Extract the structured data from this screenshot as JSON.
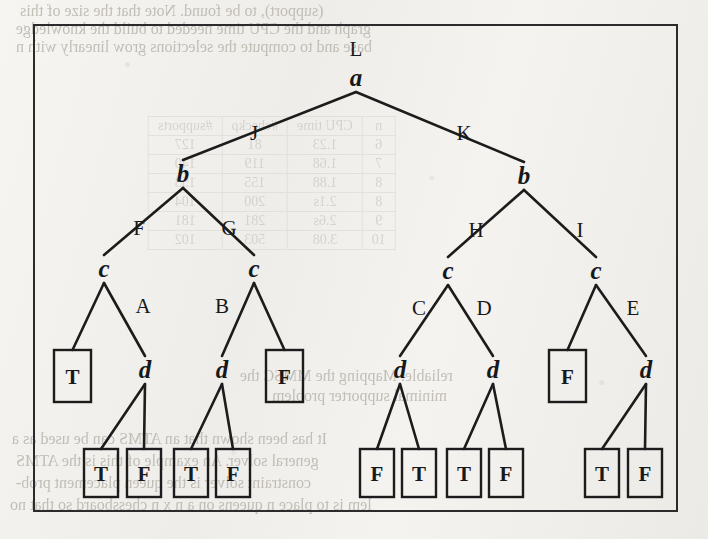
{
  "figure": {
    "caption": "",
    "frame": {
      "x": 33,
      "y": 24,
      "width": 645,
      "height": 488,
      "border_color": "#2b2b2b"
    }
  },
  "colors": {
    "ink": "#17181a",
    "line": "#1c1c1c",
    "paper": "#f2f1ee",
    "bleed_text": "#b9b5ad"
  },
  "tree": {
    "type": "derivation-tree",
    "root_label": "L",
    "nodes": [
      {
        "id": "n0",
        "label": "a",
        "kind": "nonterminal",
        "x": 356,
        "y": 86,
        "top_label": "L"
      },
      {
        "id": "n1",
        "label": "b",
        "kind": "nonterminal",
        "x": 183,
        "y": 182
      },
      {
        "id": "n2",
        "label": "b",
        "kind": "nonterminal",
        "x": 524,
        "y": 184
      },
      {
        "id": "n3",
        "label": "c",
        "kind": "nonterminal",
        "x": 104,
        "y": 277
      },
      {
        "id": "n4",
        "label": "c",
        "kind": "nonterminal",
        "x": 254,
        "y": 277
      },
      {
        "id": "n5",
        "label": "c",
        "kind": "nonterminal",
        "x": 448,
        "y": 279
      },
      {
        "id": "n6",
        "label": "c",
        "kind": "nonterminal",
        "x": 596,
        "y": 279
      },
      {
        "id": "n7",
        "label": "d",
        "kind": "nonterminal",
        "x": 145,
        "y": 378
      },
      {
        "id": "n8",
        "label": "d",
        "kind": "nonterminal",
        "x": 222,
        "y": 378
      },
      {
        "id": "n9",
        "label": "d",
        "kind": "nonterminal",
        "x": 400,
        "y": 378
      },
      {
        "id": "n10",
        "label": "d",
        "kind": "nonterminal",
        "x": 493,
        "y": 378
      },
      {
        "id": "n11",
        "label": "d",
        "kind": "nonterminal",
        "x": 646,
        "y": 378
      }
    ],
    "leaves": [
      {
        "id": "L1",
        "label": "T",
        "x": 54,
        "y": 350,
        "width": 37,
        "height": 52
      },
      {
        "id": "L2",
        "label": "F",
        "x": 266,
        "y": 350,
        "width": 37,
        "height": 52
      },
      {
        "id": "L3",
        "label": "F",
        "x": 549,
        "y": 350,
        "width": 37,
        "height": 52
      },
      {
        "id": "L4",
        "label": "T",
        "x": 84,
        "y": 449,
        "width": 34,
        "height": 48
      },
      {
        "id": "L5",
        "label": "F",
        "x": 127,
        "y": 449,
        "width": 34,
        "height": 48
      },
      {
        "id": "L6",
        "label": "T",
        "x": 174,
        "y": 449,
        "width": 34,
        "height": 48
      },
      {
        "id": "L7",
        "label": "F",
        "x": 216,
        "y": 449,
        "width": 34,
        "height": 48
      },
      {
        "id": "L8",
        "label": "F",
        "x": 360,
        "y": 449,
        "width": 34,
        "height": 48
      },
      {
        "id": "L9",
        "label": "T",
        "x": 402,
        "y": 449,
        "width": 34,
        "height": 48
      },
      {
        "id": "L10",
        "label": "T",
        "x": 447,
        "y": 449,
        "width": 34,
        "height": 48
      },
      {
        "id": "L11",
        "label": "F",
        "x": 489,
        "y": 449,
        "width": 34,
        "height": 48
      },
      {
        "id": "L12",
        "label": "T",
        "x": 585,
        "y": 449,
        "width": 34,
        "height": 48
      },
      {
        "id": "L13",
        "label": "F",
        "x": 628,
        "y": 449,
        "width": 34,
        "height": 48
      }
    ],
    "edges": [
      {
        "from": "n0",
        "to": "n1",
        "label": "J",
        "label_x": 254,
        "label_y": 140
      },
      {
        "from": "n0",
        "to": "n2",
        "label": "K",
        "label_x": 464,
        "label_y": 140
      },
      {
        "from": "n1",
        "to": "n3",
        "label": "F",
        "label_x": 139,
        "label_y": 235
      },
      {
        "from": "n1",
        "to": "n4",
        "label": "G",
        "label_x": 229,
        "label_y": 235
      },
      {
        "from": "n2",
        "to": "n5",
        "label": "H",
        "label_x": 476,
        "label_y": 237
      },
      {
        "from": "n2",
        "to": "n6",
        "label": "I",
        "label_x": 580,
        "label_y": 237
      },
      {
        "from": "n3",
        "to": "L1",
        "label": "",
        "label_x": 0,
        "label_y": 0
      },
      {
        "from": "n3",
        "to": "n7",
        "label": "A",
        "label_x": 143,
        "label_y": 313
      },
      {
        "from": "n4",
        "to": "n8",
        "label": "B",
        "label_x": 222,
        "label_y": 313
      },
      {
        "from": "n4",
        "to": "L2",
        "label": "",
        "label_x": 0,
        "label_y": 0
      },
      {
        "from": "n5",
        "to": "n9",
        "label": "C",
        "label_x": 419,
        "label_y": 315
      },
      {
        "from": "n5",
        "to": "n10",
        "label": "D",
        "label_x": 484,
        "label_y": 315
      },
      {
        "from": "n6",
        "to": "L3",
        "label": "",
        "label_x": 0,
        "label_y": 0
      },
      {
        "from": "n6",
        "to": "n11",
        "label": "E",
        "label_x": 633,
        "label_y": 315
      },
      {
        "from": "n7",
        "to": "L4",
        "label": "",
        "label_x": 0,
        "label_y": 0
      },
      {
        "from": "n7",
        "to": "L5",
        "label": "",
        "label_x": 0,
        "label_y": 0
      },
      {
        "from": "n8",
        "to": "L6",
        "label": "",
        "label_x": 0,
        "label_y": 0
      },
      {
        "from": "n8",
        "to": "L7",
        "label": "",
        "label_x": 0,
        "label_y": 0
      },
      {
        "from": "n9",
        "to": "L8",
        "label": "",
        "label_x": 0,
        "label_y": 0
      },
      {
        "from": "n9",
        "to": "L9",
        "label": "",
        "label_x": 0,
        "label_y": 0
      },
      {
        "from": "n10",
        "to": "L10",
        "label": "",
        "label_x": 0,
        "label_y": 0
      },
      {
        "from": "n10",
        "to": "L11",
        "label": "",
        "label_x": 0,
        "label_y": 0
      },
      {
        "from": "n11",
        "to": "L12",
        "label": "",
        "label_x": 0,
        "label_y": 0
      },
      {
        "from": "n11",
        "to": "L13",
        "label": "",
        "label_x": 0,
        "label_y": 0
      }
    ]
  },
  "bleed_through": {
    "note": "mirrored show-through text from the reverse side of the scanned page",
    "lines": [
      {
        "text": "(support), to be found.  Note that the size of this",
        "x": 20,
        "y": 2,
        "size": 16
      },
      {
        "text": "graph and the CPU time needed to build the knowledge",
        "x": 16,
        "y": 20,
        "size": 16
      },
      {
        "text": "base and to compute the selections grow linearly with n",
        "x": 16,
        "y": 38,
        "size": 16
      },
      {
        "text": "reliable.  Mapping the MMSC the",
        "x": 240,
        "y": 367,
        "size": 16
      },
      {
        "text": "minimal supporter problem",
        "x": 272,
        "y": 387,
        "size": 16
      },
      {
        "text": "It has been shown that an ATMS can be used as a",
        "x": 12,
        "y": 430,
        "size": 16
      },
      {
        "text": "general solver. An example of this is the ATMS",
        "x": 16,
        "y": 452,
        "size": 16
      },
      {
        "text": "constraint solver is the queen placement prob-",
        "x": 16,
        "y": 474,
        "size": 16
      },
      {
        "text": "lem is to place n queens on a n x n chessboard so that no",
        "x": 10,
        "y": 496,
        "size": 16
      }
    ],
    "table": {
      "x": 148,
      "y": 116,
      "headers": [
        "n",
        "CPU time",
        "#checkρ",
        "#supports"
      ],
      "rows": [
        [
          "6",
          "1.23",
          "81",
          "127"
        ],
        [
          "7",
          "1.68",
          "119",
          "140"
        ],
        [
          "8",
          "1.88",
          "155",
          "153"
        ],
        [
          "8",
          "2.1s",
          "200",
          "104"
        ],
        [
          "9",
          "2.6s",
          "281",
          "181"
        ],
        [
          "10",
          "3.08",
          "503",
          "102"
        ]
      ]
    }
  }
}
